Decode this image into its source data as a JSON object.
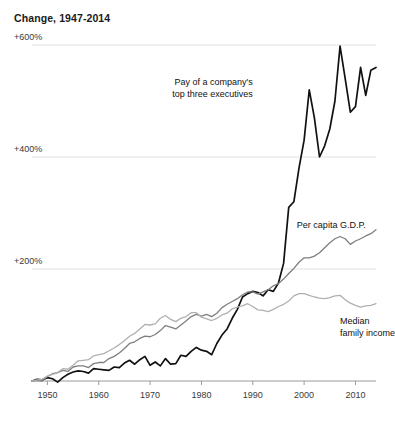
{
  "chart_data": {
    "type": "line",
    "title": "Change, 1947-2014",
    "xlabel": "",
    "ylabel": "",
    "xlim": [
      1947,
      2014
    ],
    "ylim": [
      0,
      650
    ],
    "grid": true,
    "legend_position": "inline-annotations",
    "y_ticks": [
      {
        "value": 600,
        "label": "+600%"
      },
      {
        "value": 400,
        "label": "+400%"
      },
      {
        "value": 200,
        "label": "+200%"
      }
    ],
    "x_ticks": [
      {
        "value": 1950,
        "label": "1950"
      },
      {
        "value": 1960,
        "label": "1960"
      },
      {
        "value": 1970,
        "label": "1970"
      },
      {
        "value": 1980,
        "label": "1980"
      },
      {
        "value": 1990,
        "label": "1990"
      },
      {
        "value": 2000,
        "label": "2000"
      },
      {
        "value": 2010,
        "label": "2010"
      }
    ],
    "annotations": [
      {
        "id": "exec-pay",
        "text_lines": [
          "Pay of a company's",
          "top three executives"
        ],
        "x": 1990,
        "y": 545,
        "align": "right"
      },
      {
        "id": "gdp",
        "text_lines": [
          "Per capita G.D.P."
        ],
        "x": 2012,
        "y": 290,
        "align": "right"
      },
      {
        "id": "median-income",
        "text_lines": [
          "Median",
          "family income"
        ],
        "x": 2007,
        "y": 118,
        "align": "left"
      }
    ],
    "series": [
      {
        "name": "Pay of a company's top three executives",
        "color": "#111111",
        "width": 1.7,
        "x": [
          1947,
          1948,
          1949,
          1950,
          1951,
          1952,
          1953,
          1954,
          1955,
          1956,
          1957,
          1958,
          1959,
          1960,
          1961,
          1962,
          1963,
          1964,
          1965,
          1966,
          1967,
          1968,
          1969,
          1970,
          1971,
          1972,
          1973,
          1974,
          1975,
          1976,
          1977,
          1978,
          1979,
          1980,
          1981,
          1982,
          1983,
          1984,
          1985,
          1986,
          1987,
          1988,
          1989,
          1990,
          1991,
          1992,
          1993,
          1994,
          1995,
          1996,
          1997,
          1998,
          1999,
          2000,
          2001,
          2002,
          2003,
          2004,
          2005,
          2006,
          2007,
          2008,
          2009,
          2010,
          2011,
          2012,
          2013,
          2014
        ],
        "values": [
          0,
          3,
          2,
          6,
          4,
          -2,
          6,
          12,
          16,
          18,
          17,
          14,
          22,
          21,
          20,
          19,
          25,
          24,
          32,
          37,
          30,
          38,
          44,
          28,
          34,
          27,
          40,
          30,
          31,
          46,
          44,
          53,
          60,
          55,
          53,
          47,
          67,
          82,
          93,
          112,
          128,
          150,
          156,
          160,
          158,
          152,
          163,
          160,
          175,
          210,
          310,
          320,
          380,
          430,
          520,
          470,
          400,
          420,
          450,
          500,
          598,
          540,
          480,
          490,
          560,
          510,
          555,
          560
        ]
      },
      {
        "name": "Per capita G.D.P.",
        "color": "#7f7f7f",
        "width": 1.3,
        "x": [
          1947,
          1948,
          1949,
          1950,
          1951,
          1952,
          1953,
          1954,
          1955,
          1956,
          1957,
          1958,
          1959,
          1960,
          1961,
          1962,
          1963,
          1964,
          1965,
          1966,
          1967,
          1968,
          1969,
          1970,
          1971,
          1972,
          1973,
          1974,
          1975,
          1976,
          1977,
          1978,
          1979,
          1980,
          1981,
          1982,
          1983,
          1984,
          1985,
          1986,
          1987,
          1988,
          1989,
          1990,
          1991,
          1992,
          1993,
          1994,
          1995,
          1996,
          1997,
          1998,
          1999,
          2000,
          2001,
          2002,
          2003,
          2004,
          2005,
          2006,
          2007,
          2008,
          2009,
          2010,
          2011,
          2012,
          2013,
          2014
        ],
        "values": [
          0,
          1,
          0,
          8,
          13,
          15,
          19,
          17,
          25,
          27,
          27,
          24,
          31,
          33,
          33,
          40,
          44,
          50,
          58,
          67,
          70,
          76,
          80,
          79,
          83,
          90,
          99,
          96,
          93,
          100,
          107,
          115,
          119,
          116,
          119,
          115,
          121,
          131,
          137,
          142,
          147,
          154,
          159,
          159,
          155,
          159,
          163,
          170,
          174,
          182,
          192,
          201,
          212,
          220,
          220,
          223,
          229,
          238,
          247,
          254,
          258,
          254,
          244,
          250,
          254,
          259,
          263,
          270
        ]
      },
      {
        "name": "Median family income",
        "color": "#b0b0b0",
        "width": 1.3,
        "x": [
          1947,
          1948,
          1949,
          1950,
          1951,
          1952,
          1953,
          1954,
          1955,
          1956,
          1957,
          1958,
          1959,
          1960,
          1961,
          1962,
          1963,
          1964,
          1965,
          1966,
          1967,
          1968,
          1969,
          1970,
          1971,
          1972,
          1973,
          1974,
          1975,
          1976,
          1977,
          1978,
          1979,
          1980,
          1981,
          1982,
          1983,
          1984,
          1985,
          1986,
          1987,
          1988,
          1989,
          1990,
          1991,
          1992,
          1993,
          1994,
          1995,
          1996,
          1997,
          1998,
          1999,
          2000,
          2001,
          2002,
          2003,
          2004,
          2005,
          2006,
          2007,
          2008,
          2009,
          2010,
          2011,
          2012,
          2013,
          2014
        ],
        "values": [
          0,
          2,
          3,
          9,
          12,
          15,
          22,
          21,
          28,
          36,
          37,
          38,
          45,
          47,
          49,
          54,
          59,
          65,
          72,
          80,
          85,
          93,
          101,
          100,
          102,
          112,
          117,
          110,
          106,
          112,
          115,
          122,
          122,
          114,
          111,
          108,
          112,
          118,
          121,
          129,
          132,
          134,
          138,
          133,
          127,
          126,
          124,
          128,
          133,
          137,
          143,
          152,
          156,
          156,
          153,
          150,
          148,
          147,
          149,
          152,
          153,
          145,
          139,
          135,
          132,
          134,
          135,
          138
        ]
      }
    ]
  }
}
